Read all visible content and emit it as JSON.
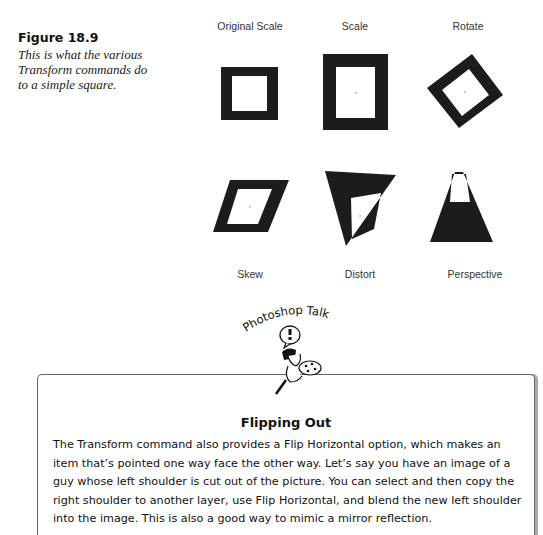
{
  "figure": {
    "title": "Figure 18.9",
    "caption": "This is what the various Transform commands do to a simple square."
  },
  "panels": [
    {
      "label": "Original Scale",
      "shape": "square"
    },
    {
      "label": "Scale",
      "shape": "scaled-rectangle"
    },
    {
      "label": "Rotate",
      "shape": "rotated-square"
    },
    {
      "label": "Skew",
      "shape": "skewed-parallelogram"
    },
    {
      "label": "Distort",
      "shape": "distorted-quadrilateral"
    },
    {
      "label": "Perspective",
      "shape": "perspective-trapezoid"
    }
  ],
  "sidebar": {
    "badge": "Photoshop Talk",
    "mascot_icon": "painter-with-palette-icon",
    "title": "Flipping Out",
    "body": "The Transform command also provides a Flip Horizontal option, which makes an item that’s pointed one way face the other way. Let’s say you have an image of a guy whose left shoulder is cut out of the picture. You can select and then copy the right shoulder to another layer, use Flip Horizontal, and blend the new left shoulder into the image. This is also a good way to mimic a mirror reflection."
  }
}
